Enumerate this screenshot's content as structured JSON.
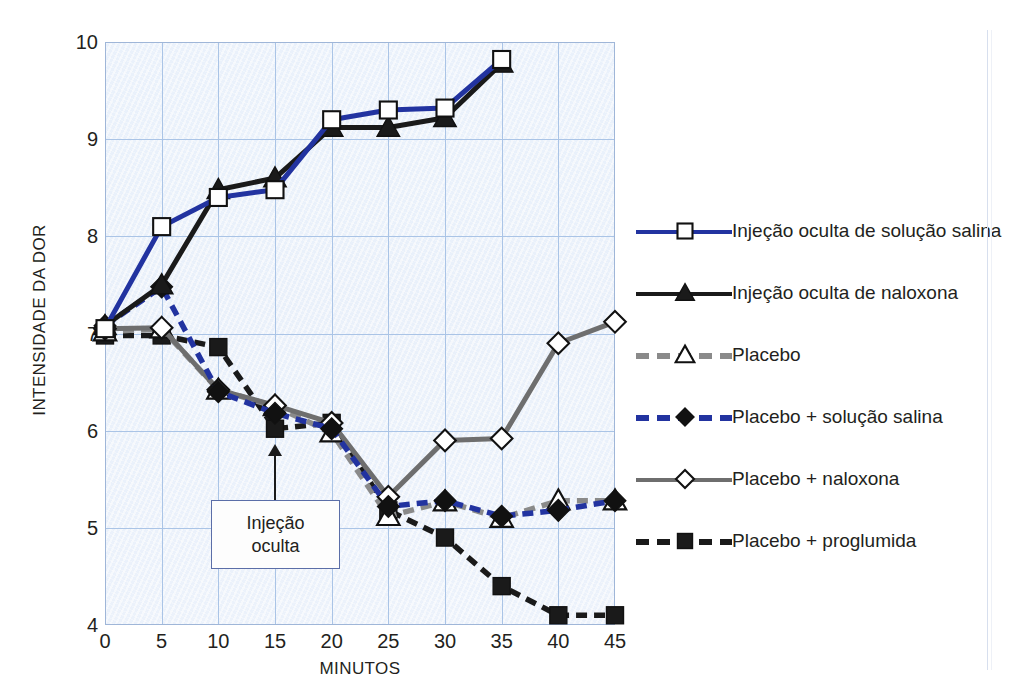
{
  "chart_data": {
    "type": "line",
    "title": "",
    "xlabel": "MINUTOS",
    "ylabel": "INTENSIDADE DA DOR",
    "x": [
      0,
      5,
      10,
      15,
      20,
      25,
      30,
      35,
      40,
      45
    ],
    "xlim": [
      0,
      45
    ],
    "ylim": [
      4,
      10
    ],
    "xticks": [
      "0",
      "5",
      "10",
      "15",
      "20",
      "25",
      "30",
      "35",
      "40",
      "45"
    ],
    "yticks": [
      "4",
      "5",
      "6",
      "7",
      "8",
      "9",
      "10"
    ],
    "grid": true,
    "legend_position": "right",
    "series": [
      {
        "name": "Injeção oculta de solução salina",
        "color": "#2233a0",
        "marker": "open-square",
        "style": "solid",
        "x": [
          0,
          5,
          10,
          15,
          20,
          25,
          30,
          35
        ],
        "values": [
          7.05,
          8.1,
          8.4,
          8.48,
          9.2,
          9.3,
          9.32,
          9.82
        ]
      },
      {
        "name": "Injeção oculta de naloxona",
        "color": "#1a1a1a",
        "marker": "filled-triangle",
        "style": "solid",
        "x": [
          0,
          5,
          10,
          15,
          20,
          25,
          30,
          35
        ],
        "values": [
          7.08,
          7.5,
          8.48,
          8.6,
          9.12,
          9.12,
          9.22,
          9.78
        ]
      },
      {
        "name": "Placebo",
        "color": "#8a8a8a",
        "marker": "open-triangle",
        "style": "dashed",
        "x": [
          0,
          5,
          10,
          15,
          20,
          25,
          30,
          35,
          40,
          45
        ],
        "values": [
          7.02,
          7.05,
          6.42,
          6.25,
          5.98,
          5.12,
          5.27,
          5.1,
          5.28,
          5.28
        ]
      },
      {
        "name": "Placebo + solução salina",
        "color": "#2233a0",
        "marker": "filled-diamond",
        "style": "dashed",
        "x": [
          0,
          5,
          10,
          15,
          20,
          25,
          30,
          35,
          40,
          45
        ],
        "values": [
          7.08,
          7.48,
          6.4,
          6.18,
          6.02,
          5.22,
          5.28,
          5.12,
          5.18,
          5.28
        ]
      },
      {
        "name": "Placebo + naloxona",
        "color": "#6e6e6e",
        "marker": "open-diamond",
        "style": "solid",
        "x": [
          0,
          5,
          10,
          15,
          20,
          25,
          30,
          35,
          40,
          45
        ],
        "values": [
          7.05,
          7.06,
          6.42,
          6.26,
          6.08,
          5.32,
          5.9,
          5.92,
          6.9,
          7.12
        ]
      },
      {
        "name": "Placebo + proglumida",
        "color": "#1a1a1a",
        "marker": "filled-square",
        "style": "dashed",
        "x": [
          0,
          5,
          10,
          15,
          20,
          25,
          30,
          35,
          40,
          45
        ],
        "values": [
          6.98,
          6.98,
          6.86,
          6.02,
          6.08,
          5.18,
          4.9,
          4.4,
          4.1,
          4.1
        ]
      }
    ],
    "annotations": [
      {
        "text_line1": "Injeção",
        "text_line2": "oculta",
        "points_to_x": 15,
        "points_to_y": 5.75
      }
    ]
  },
  "legend": {
    "items": [
      {
        "label": "Injeção oculta de solução salina",
        "icon": "open-square-marker-icon"
      },
      {
        "label": "Injeção oculta de naloxona",
        "icon": "filled-triangle-marker-icon"
      },
      {
        "label": "Placebo",
        "icon": "open-triangle-marker-icon"
      },
      {
        "label": "Placebo + solução salina",
        "icon": "filled-diamond-marker-icon"
      },
      {
        "label": "Placebo + naloxona",
        "icon": "open-diamond-marker-icon"
      },
      {
        "label": "Placebo + proglumida",
        "icon": "filled-square-marker-icon"
      }
    ]
  },
  "colors": {
    "blue": "#2233a0",
    "black": "#1a1a1a",
    "gray": "#8a8a8a",
    "dark_gray": "#6e6e6e",
    "plot_background": "#eaf1fb",
    "gridline": "#aac4e6"
  }
}
